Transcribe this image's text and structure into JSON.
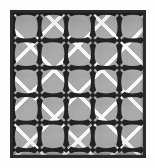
{
  "image": {
    "kind": "decorative-pattern-swatch",
    "title": "Geometric lattice tile pattern",
    "width_px": 155,
    "height_px": 168
  },
  "canvas": {
    "background_color": "#fdfdfd",
    "margin_px": 10
  },
  "frame": {
    "name": "border-frame",
    "color": "#2a2a2a",
    "thickness_px": 3,
    "left_px": 10,
    "top_px": 10,
    "width_px": 136,
    "height_px": 148
  },
  "field": {
    "background_color": "#ababab",
    "shade_color": "#969696"
  },
  "lattice": {
    "line_color": "#f8f8f8",
    "line_width_px": 3.6,
    "orientation": "diagonal-cross",
    "spacing_px": 33.6
  },
  "motif": {
    "name": "bone-dumbbell-cross",
    "color": "#232323",
    "arm_length_px": 17,
    "arm_thickness_px": 3.2,
    "cap_radius_px": 3.4,
    "node_radius_px": 3.1
  },
  "grid": {
    "columns": 5,
    "rows": 5,
    "cell_width_px": 26.6,
    "cell_height_px": 27.4,
    "node_columns": 6,
    "node_rows": 6
  },
  "palette": {
    "dark": "#232323",
    "frame": "#2a2a2a",
    "mid_gray": "#ababab",
    "shade_gray": "#969696",
    "light": "#f8f8f8",
    "paper": "#fdfdfd"
  },
  "labels": {
    "alt_text": "Square swatch of a repeating geometric pattern: gray ground with white diagonal lattice lines and dark bone-shaped bars forming crosses at each grid node, enclosed by a dark square border."
  }
}
